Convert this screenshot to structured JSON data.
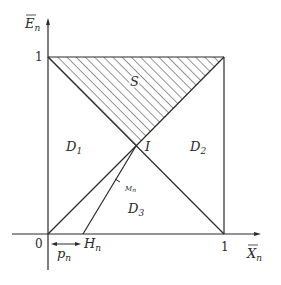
{
  "diagram": {
    "axes": {
      "x_label": "X",
      "x_label_sub": "n",
      "y_label": "E",
      "y_label_sub": "n",
      "origin_label": "0",
      "x_tick_label": "1",
      "y_tick_label": "1"
    },
    "regions": {
      "shaded": "S",
      "d1": "D",
      "d1_sub": "1",
      "d2": "D",
      "d2_sub": "2",
      "d3": "D",
      "d3_sub": "3"
    },
    "points": {
      "intersection": "I",
      "h": "H",
      "h_sub": "n",
      "m": "M",
      "m_sub": "n"
    },
    "arrow_label": "p",
    "arrow_label_sub": "n",
    "colors": {
      "line": "#2a2a2a",
      "background": "#ffffff"
    }
  }
}
